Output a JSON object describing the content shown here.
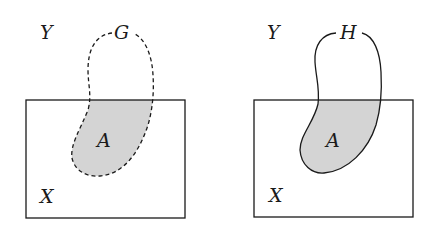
{
  "figure": {
    "panels": [
      {
        "id": "left",
        "universe_label": "Y",
        "set_label": "X",
        "curve_label": "G",
        "region_label": "A",
        "curve_style": "dashed"
      },
      {
        "id": "right",
        "universe_label": "Y",
        "set_label": "X",
        "curve_label": "H",
        "region_label": "A",
        "curve_style": "solid"
      }
    ],
    "colors": {
      "stroke": "#1a1a1a",
      "region_fill": "#d4d4d4",
      "background": "#ffffff"
    }
  }
}
